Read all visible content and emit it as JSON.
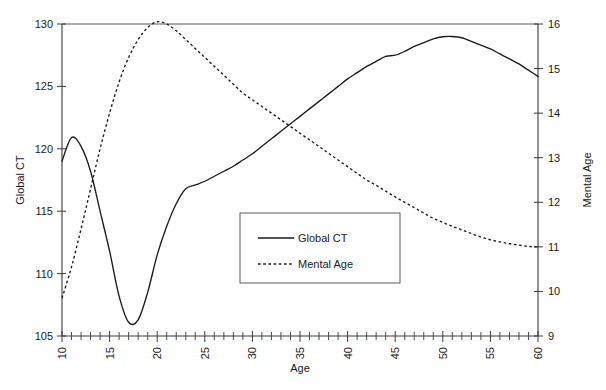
{
  "chart_data": {
    "type": "line",
    "title": "",
    "xlabel": "Age",
    "ylabel": "Global CT",
    "y2label": "Mental Age",
    "xlim": [
      10,
      60
    ],
    "ylim": [
      105,
      130
    ],
    "y2lim": [
      9,
      16
    ],
    "grid": false,
    "legend_position": "center",
    "x_ticks": [
      10,
      15,
      20,
      25,
      30,
      35,
      40,
      45,
      50,
      55,
      60
    ],
    "x_tick_labels": [
      "10",
      "15",
      "20",
      "25",
      "30",
      "35",
      "40",
      "45",
      "50",
      "55",
      "60"
    ],
    "x_minor_tick_step": 1,
    "y_ticks": [
      105,
      110,
      115,
      120,
      125,
      130
    ],
    "y_tick_labels": [
      "105",
      "110",
      "115",
      "120",
      "125",
      "130"
    ],
    "y2_ticks": [
      9,
      10,
      11,
      12,
      13,
      14,
      15,
      16
    ],
    "y2_tick_labels": [
      "9",
      "10",
      "11",
      "12",
      "13",
      "14",
      "15",
      "16"
    ],
    "x": [
      10,
      11,
      12,
      13,
      14,
      15,
      16,
      17,
      18,
      19,
      20,
      21,
      22,
      23,
      24,
      25,
      26,
      27,
      28,
      29,
      30,
      31,
      32,
      33,
      34,
      35,
      36,
      37,
      38,
      39,
      40,
      41,
      42,
      43,
      44,
      45,
      46,
      47,
      48,
      49,
      50,
      51,
      52,
      53,
      54,
      55,
      56,
      57,
      58,
      59,
      60
    ],
    "series": [
      {
        "name": "Global CT",
        "axis": "left",
        "style": "solid",
        "values": [
          119.0,
          120.9,
          120.2,
          118.2,
          115.0,
          111.8,
          108.2,
          106.1,
          106.3,
          108.5,
          111.5,
          113.8,
          115.6,
          116.8,
          117.1,
          117.4,
          117.8,
          118.2,
          118.6,
          119.1,
          119.6,
          120.2,
          120.8,
          121.4,
          122.0,
          122.6,
          123.2,
          123.8,
          124.4,
          125.0,
          125.6,
          126.1,
          126.6,
          127.0,
          127.4,
          127.5,
          127.8,
          128.2,
          128.5,
          128.8,
          128.98,
          129.0,
          128.9,
          128.6,
          128.3,
          128.0,
          127.6,
          127.2,
          126.8,
          126.3,
          125.8
        ]
      },
      {
        "name": "Mental Age",
        "axis": "right",
        "style": "dashed",
        "values": [
          9.85,
          10.55,
          11.4,
          12.3,
          13.2,
          14.0,
          14.7,
          15.25,
          15.65,
          15.92,
          16.05,
          16.0,
          15.85,
          15.65,
          15.45,
          15.25,
          15.05,
          14.85,
          14.65,
          14.45,
          14.3,
          14.15,
          14.0,
          13.85,
          13.7,
          13.55,
          13.4,
          13.25,
          13.1,
          12.95,
          12.8,
          12.65,
          12.5,
          12.38,
          12.25,
          12.12,
          12.0,
          11.88,
          11.76,
          11.64,
          11.55,
          11.46,
          11.38,
          11.3,
          11.22,
          11.16,
          11.11,
          11.07,
          11.04,
          11.01,
          11.0
        ]
      }
    ],
    "legend_entries": [
      {
        "label": "Global CT",
        "style": "solid"
      },
      {
        "label": "Mental Age",
        "style": "dashed"
      }
    ]
  }
}
